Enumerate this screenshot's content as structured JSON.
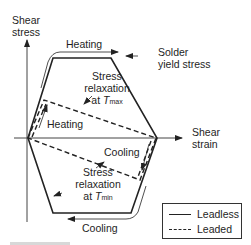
{
  "figure": {
    "y_axis_label_line1": "Shear",
    "y_axis_label_line2": "stress",
    "x_axis_label_line1": "Shear",
    "x_axis_label_line2": "strain",
    "annotations": {
      "heating_top": "Heating",
      "solder_yield_line1": "Solder",
      "solder_yield_line2": "yield stress",
      "relax_max_line1": "Stress",
      "relax_max_line2": "relaxation",
      "relax_max_at": "at ",
      "relax_max_T": "T",
      "relax_max_sub": "max",
      "heating_inner": "Heating",
      "cooling_inner": "Cooling",
      "relax_min_line1": "Stress",
      "relax_min_line2": "relaxation",
      "relax_min_at": "at ",
      "relax_min_T": "T",
      "relax_min_sub": "min",
      "cooling_bottom": "Cooling"
    },
    "legend": {
      "items": [
        {
          "label": "Leadless",
          "style": "solid"
        },
        {
          "label": "Leaded",
          "style": "dashed"
        }
      ]
    },
    "colors": {
      "line": "#222222",
      "axis": "#444444",
      "text": "#1e1e1e"
    }
  }
}
